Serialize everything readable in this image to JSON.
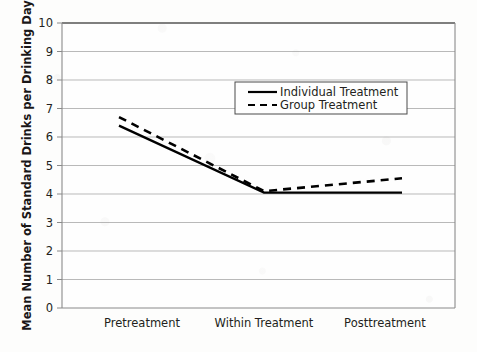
{
  "chart_data": {
    "type": "line",
    "title": "",
    "xlabel": "",
    "ylabel": "Mean Number of Standard Drinks per Drinking Day",
    "categories": [
      "Pretreatment",
      "Within Treatment",
      "Posttreatment"
    ],
    "series": [
      {
        "name": "Individual Treatment",
        "style": "solid",
        "values": [
          6.4,
          4.05,
          4.05
        ]
      },
      {
        "name": "Group Treatment",
        "style": "dashed",
        "values": [
          6.7,
          4.1,
          4.55
        ]
      }
    ],
    "ylim": [
      0,
      10
    ],
    "ytick_labels": [
      "0",
      "1",
      "2",
      "3",
      "4",
      "5",
      "6",
      "7",
      "8",
      "9",
      "10"
    ],
    "yticks": [
      0,
      1,
      2,
      3,
      4,
      5,
      6,
      7,
      8,
      9,
      10
    ],
    "grid": "horizontal",
    "legend_position": "upper-center",
    "colors": {
      "line": "#000000",
      "grid": "#b8b8b8",
      "axis": "#6e6e6e",
      "background": "#fdfdfc",
      "text": "#231f20"
    }
  },
  "legend": {
    "entries": [
      {
        "label": "Individual Treatment",
        "style": "solid"
      },
      {
        "label": "Group Treatment",
        "style": "dashed"
      }
    ]
  }
}
